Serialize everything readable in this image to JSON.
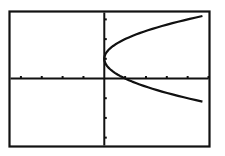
{
  "chart_data": {
    "type": "line",
    "title": "",
    "xlabel": "",
    "ylabel": "",
    "xlim": [
      -4.5,
      5
    ],
    "ylim": [
      -3.4,
      3.35
    ],
    "x_tick_step": 1,
    "y_tick_step": 1,
    "grid": false,
    "legend": false,
    "series": [
      {
        "name": "x = (y - 1)^2",
        "relation": "x = (y-1)^2",
        "vertex": [
          0,
          1
        ],
        "points": [
          [
            4.7,
            3.17
          ],
          [
            4.0,
            3.0
          ],
          [
            3.0,
            2.73
          ],
          [
            2.0,
            2.41
          ],
          [
            1.0,
            2.0
          ],
          [
            0.5,
            1.71
          ],
          [
            0.25,
            1.5
          ],
          [
            0.0,
            1.0
          ],
          [
            0.25,
            0.5
          ],
          [
            0.5,
            0.29
          ],
          [
            1.0,
            0.0
          ],
          [
            2.0,
            -0.41
          ],
          [
            3.0,
            -0.73
          ],
          [
            4.0,
            -1.0
          ],
          [
            4.7,
            -1.17
          ]
        ]
      }
    ],
    "colors": {
      "background": "#ffffff",
      "axes": "#111111",
      "curve": "#111111",
      "frame": "#111111"
    }
  }
}
